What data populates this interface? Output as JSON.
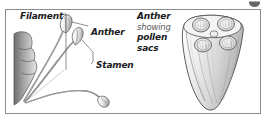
{
  "figure": {
    "style": "grayscale pen-and-ink line illustration",
    "frame_color": "#8c8c8c",
    "background_color": "#ffffff",
    "ink_color": "#4a4a4a"
  },
  "labels": {
    "filament": "Filament",
    "anther_left": "Anther",
    "stamen": "Stamen"
  },
  "caption_block": {
    "line1": "Anther",
    "line2": "showing",
    "line3": "pollen",
    "line4": "sacs"
  },
  "illustrations": {
    "left": {
      "name": "three-stamens-on-receptacle",
      "parts": [
        "receptacle-lobes",
        "filament",
        "anther"
      ],
      "stamen_count": 3
    },
    "right": {
      "name": "anther-cross-section",
      "pollen_sac_count": 4,
      "arrangement": "2x2"
    }
  },
  "corner": {
    "mark": "page-corner-mark"
  }
}
